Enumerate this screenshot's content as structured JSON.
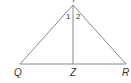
{
  "diagram": {
    "type": "triangle-with-altitude",
    "vertices": {
      "apex": {
        "label": "Y",
        "x": 73,
        "y": 5
      },
      "left": {
        "label": "Q",
        "x": 20,
        "y": 64
      },
      "right": {
        "label": "R",
        "x": 126,
        "y": 64
      },
      "foot": {
        "label": "Z",
        "x": 73,
        "y": 64
      }
    },
    "angles": {
      "angle1": "1",
      "angle2": "2"
    },
    "colors": {
      "line": "#888888",
      "text": "#333333"
    }
  }
}
